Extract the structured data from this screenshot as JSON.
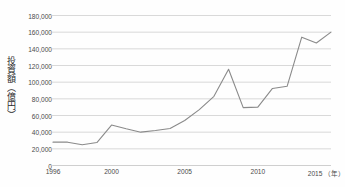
{
  "chart_data": {
    "type": "line",
    "title": "",
    "xlabel": "年",
    "ylabel": "投資額（億円）",
    "x_unit_label": "（年）",
    "ylim": [
      0,
      180000
    ],
    "xlim": [
      1996,
      2015
    ],
    "grid": true,
    "legend": "none",
    "line_color": "#8a8a8a",
    "grid_color": "#c9c9c9",
    "axis_text_color": "#4a4a4a",
    "y_ticks": [
      0,
      20000,
      40000,
      60000,
      80000,
      100000,
      120000,
      140000,
      160000,
      180000
    ],
    "y_tick_labels": [
      "0",
      "20,000",
      "40,000",
      "60,000",
      "80,000",
      "100,000",
      "120,000",
      "140,000",
      "160,000",
      "180,000"
    ],
    "x_ticks": [
      1996,
      2000,
      2005,
      2010,
      2015
    ],
    "x_tick_labels": [
      "1996",
      "2000",
      "2005",
      "2010",
      "2015"
    ],
    "x": [
      1996,
      1997,
      1998,
      1999,
      2000,
      2001,
      2002,
      2003,
      2004,
      2005,
      2006,
      2007,
      2008,
      2009,
      2010,
      2011,
      2012,
      2013,
      2014,
      2015
    ],
    "values": [
      28000,
      28000,
      25000,
      27500,
      48500,
      44000,
      40000,
      42000,
      44500,
      54000,
      67000,
      83000,
      115500,
      69500,
      70000,
      92500,
      95000,
      154000,
      147000,
      160000
    ],
    "series": [
      {
        "name": "投資額",
        "values": [
          28000,
          28000,
          25000,
          27500,
          48500,
          44000,
          40000,
          42000,
          44500,
          54000,
          67000,
          83000,
          115500,
          69500,
          70000,
          92500,
          95000,
          154000,
          147000,
          160000
        ]
      }
    ]
  }
}
